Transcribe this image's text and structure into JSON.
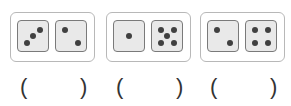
{
  "groups": [
    {
      "dice": [
        3,
        2
      ],
      "answer_blank": {
        "open": "(",
        "close": ")",
        "value": ""
      }
    },
    {
      "dice": [
        1,
        5
      ],
      "answer_blank": {
        "open": "(",
        "close": ")",
        "value": ""
      }
    },
    {
      "dice": [
        2,
        4
      ],
      "answer_blank": {
        "open": "(",
        "close": ")",
        "value": ""
      }
    }
  ],
  "colors": {
    "frame": "#b8b8b8",
    "die_border": "#7a7a7a",
    "die_fill": "#e9e9e9",
    "pip": "#404040"
  }
}
